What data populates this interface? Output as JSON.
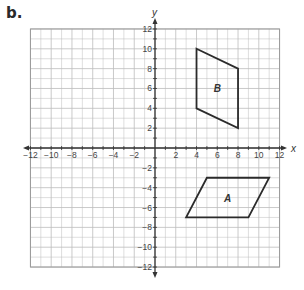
{
  "part_label": "b.",
  "axes": {
    "x_label": "x",
    "y_label": "y",
    "x_range": [
      -12,
      12
    ],
    "y_range": [
      -12,
      12
    ],
    "x_ticks": [
      "-12",
      "-10",
      "-8",
      "-6",
      "-4",
      "-2",
      "2",
      "4",
      "6",
      "8",
      "10",
      "12"
    ],
    "y_ticks": [
      "12",
      "10",
      "8",
      "6",
      "4",
      "2",
      "-2",
      "-4",
      "-6",
      "-8",
      "-10",
      "-12"
    ]
  },
  "shapes": [
    {
      "name": "A",
      "vertices": [
        [
          5,
          -3
        ],
        [
          11,
          -3
        ],
        [
          9,
          -7
        ],
        [
          3,
          -7
        ]
      ],
      "label_pos": [
        7,
        -5
      ]
    },
    {
      "name": "B",
      "vertices": [
        [
          4,
          10
        ],
        [
          8,
          8
        ],
        [
          8,
          2
        ],
        [
          4,
          4
        ]
      ],
      "label_pos": [
        6,
        6
      ]
    }
  ],
  "colors": {
    "grid": "#bdbdbd",
    "axis": "#333333",
    "shape": "#2b2b2b"
  }
}
